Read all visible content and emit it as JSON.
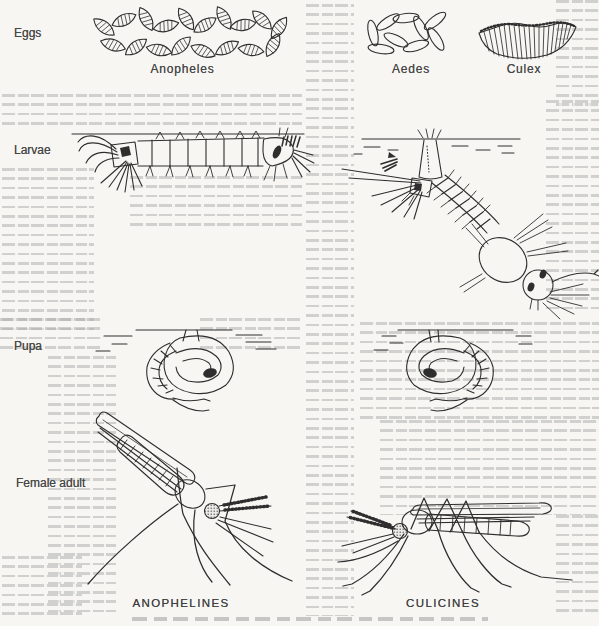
{
  "figure": {
    "rows": {
      "eggs": "Eggs",
      "larvae": "Larvae",
      "pupa": "Pupa",
      "female_adult": "Female adult"
    },
    "egg_types": {
      "anopheles": "Anopheles",
      "aedes": "Aedes",
      "culex": "Culex"
    },
    "groups": {
      "left": "ANOPHELINES",
      "right": "CULICINES"
    }
  },
  "colors": {
    "ink": "#2e2e2e",
    "paper": "#f7f6f3",
    "bleed_text": "#ababab"
  }
}
